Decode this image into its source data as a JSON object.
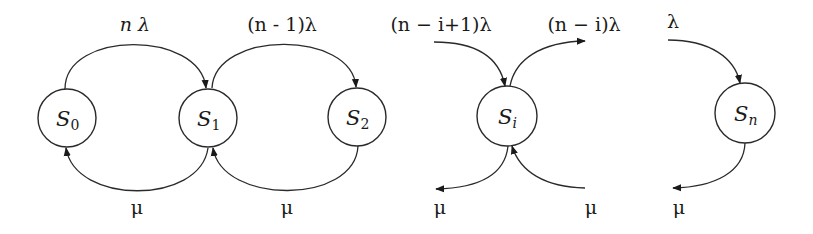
{
  "diagram": {
    "colors": {
      "stroke": "#2a2a2a",
      "text": "#1a1a1a",
      "background": "#ffffff"
    },
    "nodes": [
      {
        "id": "S0",
        "label": "S",
        "sub": "0",
        "sub_italic": false,
        "cx": 67,
        "cy": 118,
        "r": 29
      },
      {
        "id": "S1",
        "label": "S",
        "sub": "1",
        "sub_italic": false,
        "cx": 208,
        "cy": 118,
        "r": 29
      },
      {
        "id": "S2",
        "label": "S",
        "sub": "2",
        "sub_italic": false,
        "cx": 357,
        "cy": 117,
        "r": 29
      },
      {
        "id": "Si",
        "label": "S",
        "sub": "i",
        "sub_italic": true,
        "cx": 507,
        "cy": 116,
        "r": 30
      },
      {
        "id": "Sn",
        "label": "S",
        "sub": "n",
        "sub_italic": true,
        "cx": 745,
        "cy": 113,
        "r": 30
      }
    ],
    "rate_labels": {
      "s0_s1": "n λ",
      "s1_s2": "(n - 1)λ",
      "into_si": "(n − i+1)λ",
      "out_si": "(n − i)λ",
      "into_sn": "λ",
      "mu_s1_s0": "μ",
      "mu_s2_s1": "μ",
      "mu_out_si": "μ",
      "mu_into_si": "μ",
      "mu_out_sn": "μ"
    },
    "edges": [
      {
        "id": "s0-to-s1",
        "type": "birth",
        "from": "S0",
        "to": "S1",
        "rate_key": "s0_s1"
      },
      {
        "id": "s1-to-s2",
        "type": "birth",
        "from": "S1",
        "to": "S2",
        "rate_key": "s1_s2"
      },
      {
        "id": "s1-to-s0",
        "type": "death",
        "from": "S1",
        "to": "S0",
        "rate_key": "mu_s1_s0"
      },
      {
        "id": "s2-to-s1",
        "type": "death",
        "from": "S2",
        "to": "S1",
        "rate_key": "mu_s2_s1"
      },
      {
        "id": "into-si-birth",
        "type": "birth",
        "to": "Si",
        "rate_key": "into_si"
      },
      {
        "id": "out-si-birth",
        "type": "birth",
        "from": "Si",
        "rate_key": "out_si"
      },
      {
        "id": "out-si-death",
        "type": "death",
        "from": "Si",
        "rate_key": "mu_out_si"
      },
      {
        "id": "into-si-death",
        "type": "death",
        "to": "Si",
        "rate_key": "mu_into_si"
      },
      {
        "id": "into-sn-birth",
        "type": "birth",
        "to": "Sn",
        "rate_key": "into_sn"
      },
      {
        "id": "out-sn-death",
        "type": "death",
        "from": "Sn",
        "rate_key": "mu_out_sn"
      }
    ]
  }
}
